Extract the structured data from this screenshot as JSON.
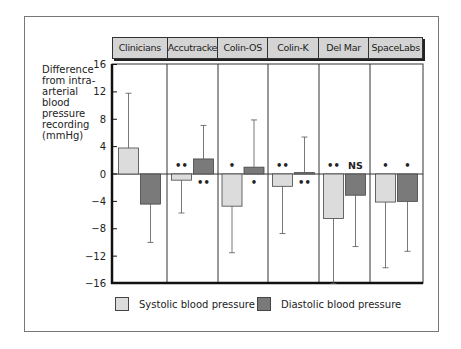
{
  "chart_data": {
    "type": "bar",
    "title": "",
    "xlabel": "",
    "ylabel": "Difference from intra-arterial blood pressure recording (mmHg)",
    "ylim": [
      -16,
      16
    ],
    "yticks": [
      16,
      12,
      8,
      4,
      0,
      -4,
      -8,
      -12,
      -16
    ],
    "ytick_labels": [
      "16",
      "12",
      "8",
      "4",
      "0",
      "−4",
      "−8",
      "−12",
      "−16"
    ],
    "categories": [
      "Clinicians",
      "Accutracker",
      "Colin-OS",
      "Colin-K",
      "Del Mar",
      "SpaceLabs"
    ],
    "series": [
      {
        "name": "Systolic blood pressure",
        "color": "#dcdcdc",
        "values": [
          3.8,
          -0.9,
          -4.7,
          -1.8,
          -6.5,
          -4.1
        ],
        "error_end": [
          11.8,
          -5.7,
          -11.5,
          -8.7,
          -16.0,
          -13.7
        ],
        "significance": [
          "",
          "**",
          "*",
          "**",
          "**",
          "*"
        ]
      },
      {
        "name": "Diastolic blood pressure",
        "color": "#7a7a7a",
        "values": [
          -4.4,
          2.2,
          1.0,
          0.2,
          -3.1,
          -4.0
        ],
        "error_end": [
          -10.0,
          7.1,
          7.9,
          5.4,
          -10.6,
          -11.3
        ],
        "significance": [
          "",
          "**",
          "*",
          "**",
          "NS",
          "*"
        ]
      }
    ],
    "grid": false,
    "legend_position": "bottom"
  },
  "ylabel_lines": [
    "Difference",
    "from intra-",
    "arterial",
    "blood",
    "pressure",
    "recording",
    "(mmHg)"
  ],
  "legend": {
    "systolic": "Systolic blood pressure",
    "diastolic": "Diastolic blood pressure"
  }
}
